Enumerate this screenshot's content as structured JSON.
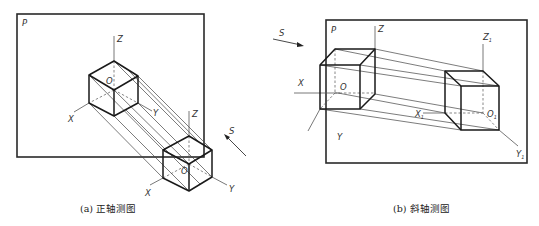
{
  "figure_a": {
    "caption": "(a) 正轴测图",
    "plane_label": "P",
    "direction_label": "S",
    "cube_on_plane": {
      "z": "Z",
      "x": "X",
      "y": "Y",
      "origin": "O"
    },
    "cube_in_space": {
      "z": "Z",
      "x": "X",
      "y": "Y",
      "origin": "O"
    }
  },
  "figure_b": {
    "caption": "(b) 斜轴测图",
    "plane_label": "P",
    "direction_label": "S",
    "cube_in_space": {
      "z": "Z",
      "x": "X",
      "y": "Y",
      "origin": "O"
    },
    "cube_on_plane": {
      "z": "Z",
      "x": "X",
      "y": "Y",
      "origin": "O",
      "subscript": "1"
    }
  }
}
